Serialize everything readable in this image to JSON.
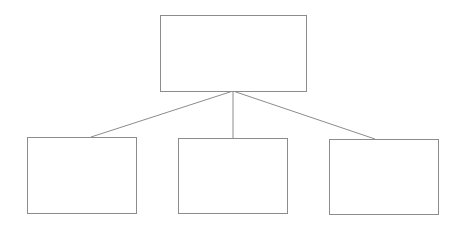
{
  "diagram": {
    "type": "tree",
    "line_color": "#8c8c8c",
    "border_color": "#8c8c8c",
    "background": "#ffffff",
    "root": {
      "id": "root",
      "label": "",
      "x": 160,
      "y": 15,
      "w": 147,
      "h": 77
    },
    "children": [
      {
        "id": "child-1",
        "label": "",
        "x": 27,
        "y": 137,
        "w": 110,
        "h": 77
      },
      {
        "id": "child-2",
        "label": "",
        "x": 178,
        "y": 138,
        "w": 110,
        "h": 76
      },
      {
        "id": "child-3",
        "label": "",
        "x": 329,
        "y": 139,
        "w": 110,
        "h": 76
      }
    ],
    "edges": [
      {
        "from": [
          233,
          91
        ],
        "to": [
          91,
          137
        ]
      },
      {
        "from": [
          233,
          91
        ],
        "to": [
          233,
          138
        ]
      },
      {
        "from": [
          233,
          91
        ],
        "to": [
          375,
          139
        ]
      }
    ]
  }
}
